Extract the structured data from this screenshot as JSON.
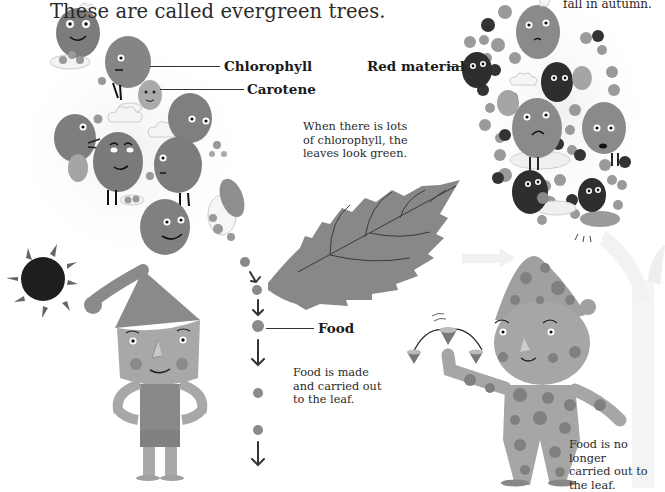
{
  "heading": "These are called evergreen trees.",
  "top_right_caption": "fall in autumn.",
  "labels": {
    "chlorophyll": "Chlorophyll",
    "carotene": "Carotene",
    "red_material": "Red material",
    "food": "Food"
  },
  "captions": {
    "green_leaves": [
      "When there is lots",
      "of chlorophyll, the",
      "leaves look green."
    ],
    "food_carried": [
      "Food is made",
      "and carried out",
      "to the leaf."
    ],
    "food_not_carried": [
      "Food is no longer",
      "carried out to",
      "the leaf."
    ]
  },
  "illustrations": {
    "left_scene": [
      "chlorophyll-characters",
      "carotene-characters",
      "sun-icon",
      "boy-in-pointed-hat",
      "food-path-arrows",
      "green-leaf"
    ],
    "right_scene": [
      "red-material-characters",
      "polka-dot-boy",
      "spinning-tops",
      "faded-tree"
    ]
  },
  "colors": {
    "background": "#ffffff",
    "text": "#222222",
    "chlorophyll": "#8a8a8a",
    "red_material_dark": "#2e2e2e",
    "leaf": "#8c8c8c",
    "sun": "#1e1e1e"
  }
}
